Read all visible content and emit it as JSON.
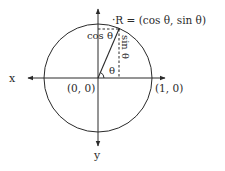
{
  "diagram": {
    "type": "unit-circle",
    "labels": {
      "x_axis": "x",
      "y_axis": "y",
      "origin": "(0, 0)",
      "unit_point": "(1, 0)",
      "point_r": "·R = (cos θ, sin θ)",
      "cos_label": "cos θ",
      "sin_label": "sin θ",
      "angle_label": "θ"
    },
    "colors": {
      "stroke": "#2a2a2a",
      "background": "#ffffff"
    }
  }
}
